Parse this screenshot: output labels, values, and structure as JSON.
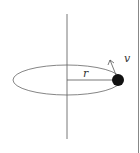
{
  "diagram": {
    "labels": {
      "radius": "r",
      "velocity": "v"
    },
    "elements": {
      "axis": "vertical rotation axis",
      "orbit": "elliptical (perspective circle) path",
      "mass": "solid black ball",
      "velocity_arrow": "tangential velocity arrow"
    },
    "colors": {
      "line": "#555555",
      "mass": "#111111",
      "right_border": "#888888"
    }
  }
}
